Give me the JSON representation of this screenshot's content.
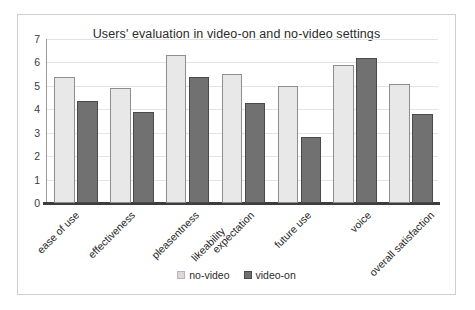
{
  "figure": {
    "title": "Users' evaluation in video-on and no-video settings"
  },
  "legend": {
    "position": "bottom-center",
    "entries": [
      {
        "label": "no-video",
        "color": "#e8e8e8"
      },
      {
        "label": "video-on",
        "color": "#717171"
      }
    ]
  },
  "axis": {
    "y_ticks": [
      "7",
      "6",
      "5",
      "4",
      "3",
      "2",
      "1",
      "0"
    ]
  },
  "chart_data": {
    "type": "bar",
    "title": "Users' evaluation in video-on and no-video settings",
    "xlabel": "",
    "ylabel": "",
    "ylim": [
      0,
      7
    ],
    "ytick_step": 1,
    "grid": true,
    "legend_position": "bottom-center",
    "categories": [
      "ease of use",
      "effectiveness",
      "pleasentness",
      "likeability",
      "expectation",
      "future use",
      "voice",
      "overall satisfaction"
    ],
    "category_label_rotation": -45,
    "series": [
      {
        "name": "no-video",
        "color": "#e8e8e8",
        "values": [
          5.4,
          4.9,
          6.3,
          5.5,
          null,
          5.0,
          5.9,
          5.1
        ]
      },
      {
        "name": "video-on",
        "color": "#717171",
        "values": [
          4.35,
          3.9,
          5.4,
          4.25,
          null,
          2.8,
          6.2,
          3.8
        ]
      }
    ],
    "note": "Seven plotted bar groups; the tick labels 'pleasentness' and 'likeability' share one group and 'expectation' labels the next group."
  },
  "plotted_groups": [
    {
      "label": "ease of use",
      "no_video": 5.4,
      "video_on": 4.35
    },
    {
      "label": "effectiveness",
      "no_video": 4.9,
      "video_on": 3.9
    },
    {
      "label": "pleasentness",
      "no_video": 6.3,
      "video_on": 5.4
    },
    {
      "label": "likeability",
      "no_video": 5.5,
      "video_on": 4.25
    },
    {
      "label": "future use",
      "no_video": 5.0,
      "video_on": 2.8
    },
    {
      "label": "voice",
      "no_video": 5.9,
      "video_on": 6.2
    },
    {
      "label": "overall satisfaction",
      "no_video": 5.1,
      "video_on": 3.8
    }
  ],
  "xtick_labels": [
    "ease of use",
    "effectiveness",
    "pleasentness",
    "likeability",
    "expectation",
    "future use",
    "voice",
    "overall satisfaction"
  ]
}
